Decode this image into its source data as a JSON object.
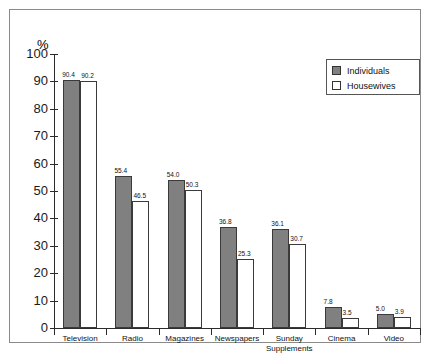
{
  "chart_data": {
    "type": "bar",
    "title": "",
    "xlabel": "",
    "ylabel": "%",
    "ylim": [
      0,
      100
    ],
    "ytick_step": 10,
    "yticks": [
      "0",
      "10",
      "20",
      "30",
      "40",
      "50",
      "60",
      "70",
      "80",
      "90",
      "100"
    ],
    "grid": false,
    "legend_position": "top-right",
    "categories": [
      "Television",
      "Radio",
      "Magazines",
      "Newspapers",
      "Sunday\nSupplements",
      "Cinema",
      "Video"
    ],
    "series": [
      {
        "name": "Individuals",
        "color": "#808080",
        "values": [
          90.4,
          55.4,
          54.0,
          36.8,
          36.1,
          7.8,
          5.0
        ],
        "labels": [
          "90.4",
          "55.4",
          "54.0",
          "36.8",
          "36.1",
          "7.8",
          "5.0"
        ]
      },
      {
        "name": "Housewives",
        "color": "#ffffff",
        "values": [
          90.2,
          46.5,
          50.3,
          25.3,
          30.7,
          3.5,
          3.9
        ],
        "labels": [
          "90.2",
          "46.5",
          "50.3",
          "25.3",
          "30.7",
          "3.5",
          "3.9"
        ]
      }
    ]
  },
  "legend": {
    "items": [
      {
        "label": "Individuals",
        "swatch": "dark"
      },
      {
        "label": "Housewives",
        "swatch": "light"
      }
    ]
  },
  "axis": {
    "unit_label": "%"
  }
}
